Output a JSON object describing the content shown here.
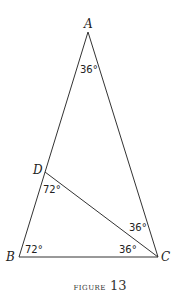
{
  "figure": {
    "caption_word": "figure",
    "caption_number": "13",
    "vertices": {
      "A": {
        "label": "A",
        "x": 88,
        "y": 32
      },
      "B": {
        "label": "B",
        "x": 19,
        "y": 257
      },
      "C": {
        "label": "C",
        "x": 158,
        "y": 257
      },
      "D": {
        "label": "D",
        "x": 45,
        "y": 172
      }
    },
    "segments": [
      [
        "A",
        "B"
      ],
      [
        "A",
        "C"
      ],
      [
        "B",
        "C"
      ],
      [
        "D",
        "C"
      ]
    ],
    "angles": {
      "A": "36°",
      "D_BDC": "72°",
      "B": "72°",
      "C_ACD": "36°",
      "C_DCB": "36°"
    }
  }
}
